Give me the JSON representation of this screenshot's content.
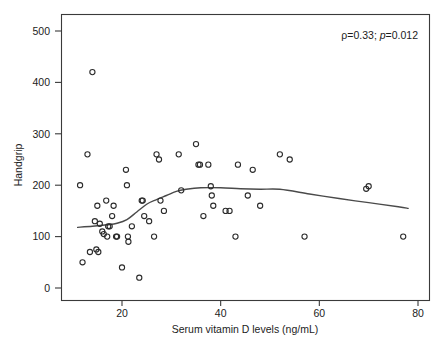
{
  "chart_data": {
    "type": "scatter",
    "title": "",
    "subtitle": "",
    "xlabel": "Serum vitamin D levels (ng/mL)",
    "ylabel": "Handgrip",
    "xlim": [
      8,
      85
    ],
    "ylim": [
      -30,
      530
    ],
    "xticks": [
      20,
      40,
      60,
      80
    ],
    "xtick_labels": [
      "20",
      "40",
      "60",
      "80"
    ],
    "yticks": [
      0,
      100,
      200,
      300,
      400,
      500
    ],
    "ytick_labels": [
      "0",
      "100",
      "200",
      "300",
      "400",
      "500"
    ],
    "grid": false,
    "legend": null,
    "annotations": [
      {
        "name": "correlation-stats",
        "text": "ρ=0.33; p=0.012",
        "rho_symbol": "ρ",
        "rho_value": "=0.33; ",
        "p_symbol": "p",
        "p_value": "=0.012",
        "x": 70,
        "y": 490
      }
    ],
    "series": [
      {
        "name": "Participants",
        "marker": "open-circle",
        "color": "#2b2b2b",
        "points": [
          [
            11.5,
            200
          ],
          [
            12.0,
            50
          ],
          [
            13.0,
            260
          ],
          [
            13.5,
            70
          ],
          [
            14.0,
            420
          ],
          [
            14.5,
            130
          ],
          [
            14.8,
            75
          ],
          [
            15.0,
            160
          ],
          [
            15.2,
            70
          ],
          [
            15.5,
            125
          ],
          [
            16.0,
            110
          ],
          [
            16.3,
            105
          ],
          [
            16.8,
            170
          ],
          [
            17.0,
            100
          ],
          [
            17.2,
            120
          ],
          [
            17.5,
            120
          ],
          [
            18.0,
            140
          ],
          [
            18.3,
            160
          ],
          [
            18.8,
            100
          ],
          [
            19.0,
            100
          ],
          [
            20.0,
            40
          ],
          [
            20.8,
            230
          ],
          [
            21.0,
            200
          ],
          [
            21.2,
            100
          ],
          [
            21.3,
            90
          ],
          [
            22.0,
            120
          ],
          [
            23.5,
            20
          ],
          [
            24.0,
            170
          ],
          [
            24.2,
            170
          ],
          [
            24.5,
            140
          ],
          [
            25.5,
            130
          ],
          [
            26.5,
            100
          ],
          [
            27.0,
            260
          ],
          [
            27.5,
            250
          ],
          [
            27.8,
            170
          ],
          [
            28.5,
            150
          ],
          [
            31.5,
            260
          ],
          [
            32.0,
            190
          ],
          [
            35.0,
            280
          ],
          [
            35.5,
            240
          ],
          [
            35.8,
            240
          ],
          [
            36.5,
            140
          ],
          [
            37.5,
            240
          ],
          [
            38.0,
            198
          ],
          [
            38.2,
            180
          ],
          [
            38.5,
            160
          ],
          [
            41.0,
            150
          ],
          [
            41.8,
            150
          ],
          [
            43.0,
            100
          ],
          [
            43.5,
            240
          ],
          [
            45.5,
            180
          ],
          [
            46.5,
            230
          ],
          [
            48.0,
            160
          ],
          [
            52.0,
            260
          ],
          [
            54.0,
            250
          ],
          [
            57.0,
            100
          ],
          [
            69.5,
            193
          ],
          [
            70.0,
            198
          ],
          [
            77.0,
            100
          ]
        ]
      }
    ],
    "fit_curve": {
      "name": "lowess-smoother",
      "color": "#4a4a4a",
      "points": [
        [
          11.0,
          118
        ],
        [
          14.0,
          120
        ],
        [
          17.0,
          123
        ],
        [
          19.0,
          126
        ],
        [
          21.0,
          133
        ],
        [
          23.0,
          148
        ],
        [
          25.0,
          163
        ],
        [
          27.0,
          172
        ],
        [
          29.0,
          180
        ],
        [
          31.0,
          188
        ],
        [
          33.0,
          192
        ],
        [
          36.0,
          195
        ],
        [
          40.0,
          195
        ],
        [
          44.0,
          193
        ],
        [
          48.0,
          192
        ],
        [
          52.0,
          192
        ],
        [
          58.0,
          183
        ],
        [
          64.0,
          174
        ],
        [
          70.0,
          166
        ],
        [
          76.0,
          158
        ],
        [
          78.0,
          155
        ]
      ]
    }
  },
  "figure": {
    "background_color": "#ffffff",
    "axis_color": "#3a3a3a",
    "marker_color": "#2b2b2b",
    "curve_color": "#4a4a4a"
  }
}
